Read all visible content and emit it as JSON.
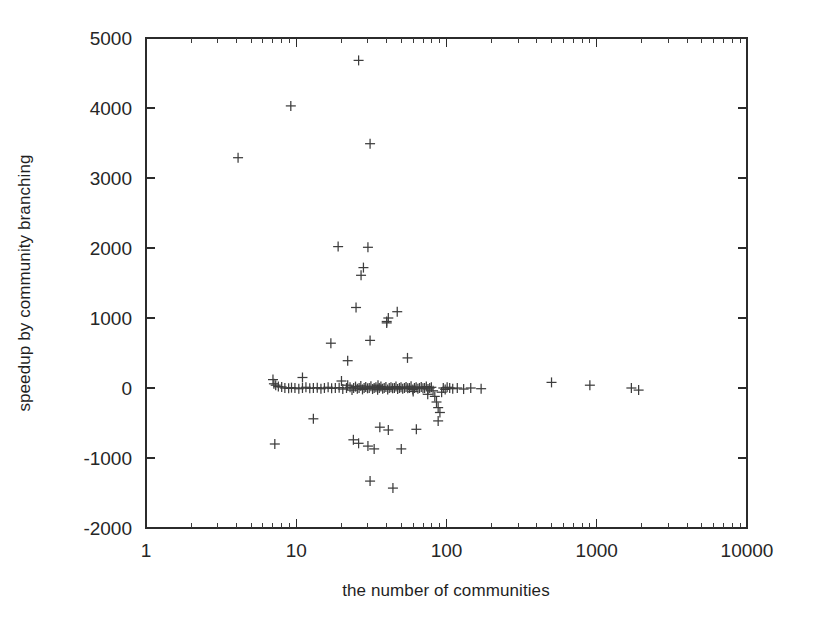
{
  "chart_data": {
    "type": "scatter",
    "title": "",
    "xlabel": "the number of communities",
    "ylabel": "speedup by community branching",
    "xscale": "log",
    "yscale": "linear",
    "xlim": [
      1,
      10000
    ],
    "ylim": [
      -2000,
      5000
    ],
    "xticks": [
      1,
      10,
      100,
      1000,
      10000
    ],
    "xticklabels": [
      "1",
      "10",
      "100",
      "1000",
      "10000"
    ],
    "yticks": [
      -2000,
      -1000,
      0,
      1000,
      2000,
      3000,
      4000,
      5000
    ],
    "yticklabels": [
      "-2000",
      "-1000",
      "0",
      "1000",
      "2000",
      "3000",
      "4000",
      "5000"
    ],
    "grid": false,
    "legend": null,
    "marker": "plus",
    "marker_color": "#3d3d3d",
    "series": [
      {
        "name": "speedup by community branching",
        "points": [
          [
            4.1,
            3290
          ],
          [
            9.2,
            4030
          ],
          [
            26,
            4680
          ],
          [
            31,
            3490
          ],
          [
            19,
            2020
          ],
          [
            30,
            2010
          ],
          [
            28,
            1720
          ],
          [
            27,
            1610
          ],
          [
            25,
            1150
          ],
          [
            31,
            680
          ],
          [
            17,
            640
          ],
          [
            22,
            390
          ],
          [
            47,
            1090
          ],
          [
            41,
            1000
          ],
          [
            40,
            950
          ],
          [
            40,
            930
          ],
          [
            55,
            430
          ],
          [
            7.0,
            120
          ],
          [
            7.1,
            60
          ],
          [
            7.3,
            40
          ],
          [
            7.6,
            20
          ],
          [
            8.0,
            15
          ],
          [
            8.4,
            0
          ],
          [
            8.9,
            -5
          ],
          [
            9.3,
            5
          ],
          [
            9.8,
            0
          ],
          [
            10.4,
            -10
          ],
          [
            11.0,
            0
          ],
          [
            11.6,
            10
          ],
          [
            12.3,
            -5
          ],
          [
            13.0,
            0
          ],
          [
            13.8,
            5
          ],
          [
            14.6,
            -10
          ],
          [
            15.4,
            0
          ],
          [
            16.3,
            10
          ],
          [
            17.2,
            -5
          ],
          [
            18.2,
            0
          ],
          [
            19.3,
            5
          ],
          [
            20.4,
            -15
          ],
          [
            21.6,
            0
          ],
          [
            22.0,
            40
          ],
          [
            22.8,
            10
          ],
          [
            23.5,
            -30
          ],
          [
            24.1,
            0
          ],
          [
            24.8,
            20
          ],
          [
            25.5,
            -10
          ],
          [
            26.2,
            0
          ],
          [
            26.9,
            30
          ],
          [
            27.6,
            -20
          ],
          [
            28.3,
            0
          ],
          [
            29.0,
            15
          ],
          [
            29.8,
            -5
          ],
          [
            30.6,
            0
          ],
          [
            31.4,
            25
          ],
          [
            32.2,
            -15
          ],
          [
            33.0,
            0
          ],
          [
            33.9,
            10
          ],
          [
            34.8,
            -25
          ],
          [
            35.7,
            0
          ],
          [
            36.6,
            20
          ],
          [
            37.6,
            -10
          ],
          [
            38.5,
            0
          ],
          [
            39.5,
            15
          ],
          [
            40.6,
            -20
          ],
          [
            41.6,
            0
          ],
          [
            42.7,
            10
          ],
          [
            43.8,
            -5
          ],
          [
            45.0,
            0
          ],
          [
            46.1,
            20
          ],
          [
            47.3,
            -15
          ],
          [
            48.6,
            0
          ],
          [
            49.8,
            10
          ],
          [
            51.1,
            -10
          ],
          [
            52.5,
            0
          ],
          [
            53.8,
            15
          ],
          [
            55.2,
            -5
          ],
          [
            56.7,
            0
          ],
          [
            58.1,
            25
          ],
          [
            59.7,
            -20
          ],
          [
            61.2,
            0
          ],
          [
            62.8,
            10
          ],
          [
            64.5,
            -10
          ],
          [
            66.1,
            0
          ],
          [
            67.9,
            15
          ],
          [
            69.7,
            -5
          ],
          [
            71.5,
            0
          ],
          [
            73.4,
            20
          ],
          [
            75.3,
            -15
          ],
          [
            77.3,
            0
          ],
          [
            79.3,
            10
          ],
          [
            81.4,
            -40
          ],
          [
            83.6,
            -120
          ],
          [
            85.8,
            -200
          ],
          [
            88.0,
            -280
          ],
          [
            90.4,
            -350
          ],
          [
            92.8,
            -60
          ],
          [
            95.2,
            0
          ],
          [
            98.0,
            -20
          ],
          [
            101,
            10
          ],
          [
            105,
            0
          ],
          [
            110,
            -10
          ],
          [
            118,
            0
          ],
          [
            130,
            -15
          ],
          [
            145,
            0
          ],
          [
            170,
            -10
          ],
          [
            500,
            80
          ],
          [
            900,
            40
          ],
          [
            1700,
            0
          ],
          [
            1900,
            -30
          ],
          [
            11,
            150
          ],
          [
            13,
            -440
          ],
          [
            7.2,
            -800
          ],
          [
            24,
            -740
          ],
          [
            26,
            -790
          ],
          [
            30,
            -830
          ],
          [
            33,
            -870
          ],
          [
            36,
            -560
          ],
          [
            41,
            -600
          ],
          [
            50,
            -870
          ],
          [
            63,
            -590
          ],
          [
            31,
            -1330
          ],
          [
            44,
            -1430
          ],
          [
            20,
            100
          ],
          [
            35,
            40
          ],
          [
            60,
            -50
          ],
          [
            75,
            -90
          ],
          [
            88,
            -470
          ]
        ]
      }
    ]
  },
  "axes": {
    "x_label": "the number of communities",
    "y_label": "speedup by community branching"
  }
}
